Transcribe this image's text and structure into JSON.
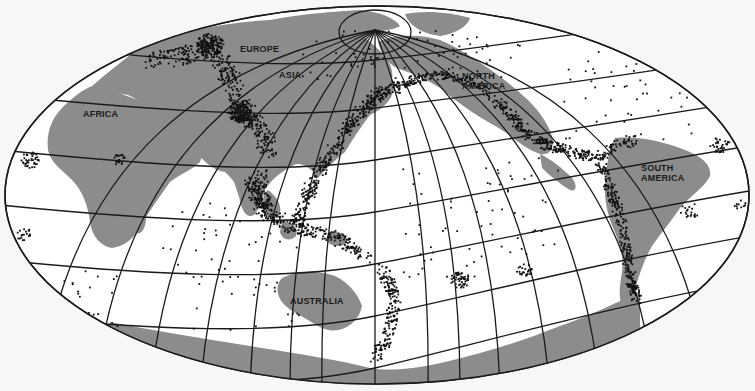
{
  "map": {
    "title": "World seismicity map",
    "projection": "oblique equal-area (ellipse), pole near top center",
    "colors": {
      "background": "#f7f7f7",
      "ocean": "#ffffff",
      "land": "#8c8c8c",
      "graticule": "#1a1a1a",
      "earthquake_dots": "#111111"
    },
    "labels": [
      {
        "id": "europe",
        "text": "EUROPE",
        "x": 240,
        "y": 44
      },
      {
        "id": "asia",
        "text": "ASIA",
        "x": 279,
        "y": 70
      },
      {
        "id": "north-america",
        "text": "NORTH\nAMERICA",
        "x": 462,
        "y": 71
      },
      {
        "id": "africa",
        "text": "AFRICA",
        "x": 83,
        "y": 109
      },
      {
        "id": "south-america",
        "text": "SOUTH\nAMERICA",
        "x": 641,
        "y": 163
      },
      {
        "id": "australia",
        "text": "AUSTRALIA",
        "x": 290,
        "y": 296
      }
    ],
    "legend": {
      "dots": "earthquake epicenters",
      "gray": "continents"
    }
  }
}
